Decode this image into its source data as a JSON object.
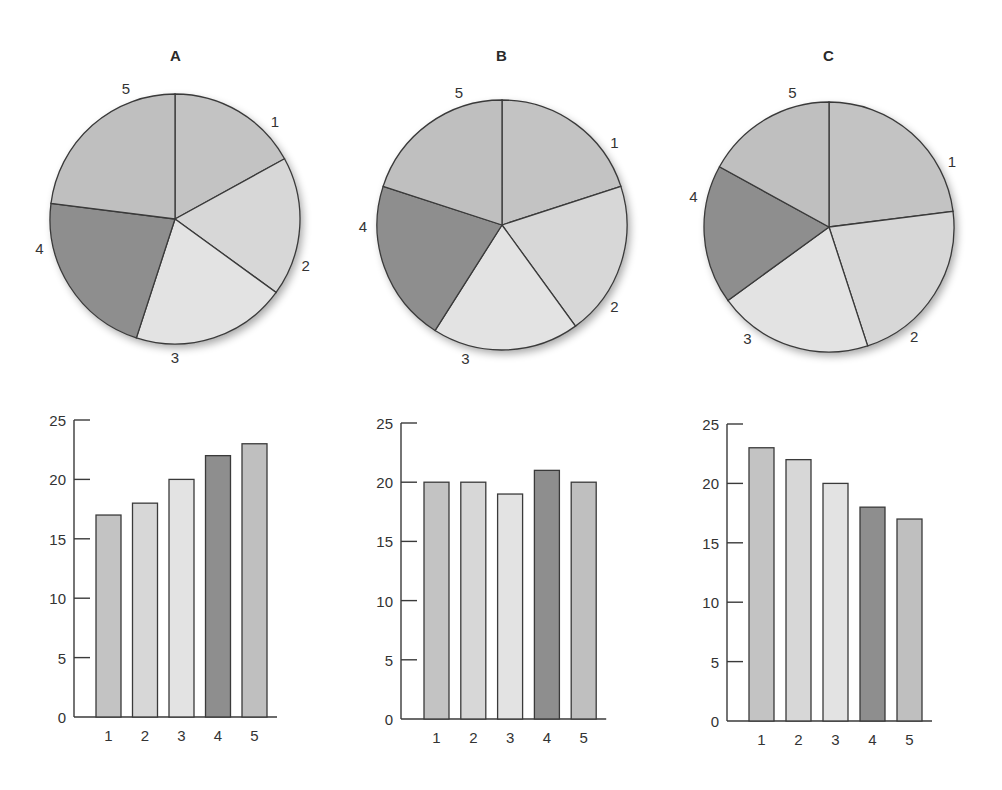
{
  "panels": [
    {
      "title": "A"
    },
    {
      "title": "B"
    },
    {
      "title": "C"
    }
  ],
  "colors": {
    "slice1": "#c3c3c3",
    "slice2": "#d7d7d7",
    "slice3": "#e3e3e3",
    "slice4": "#8e8e8e",
    "slice5": "#bfbfbf",
    "stroke": "#3a3a3a"
  },
  "chart_data": [
    {
      "type": "pie",
      "title": "A",
      "categories": [
        "1",
        "2",
        "3",
        "4",
        "5"
      ],
      "values": [
        17,
        18,
        20,
        22,
        23
      ]
    },
    {
      "type": "pie",
      "title": "B",
      "categories": [
        "1",
        "2",
        "3",
        "4",
        "5"
      ],
      "values": [
        20,
        20,
        19,
        21,
        20
      ]
    },
    {
      "type": "pie",
      "title": "C",
      "categories": [
        "1",
        "2",
        "3",
        "4",
        "5"
      ],
      "values": [
        23,
        22,
        20,
        18,
        17
      ]
    },
    {
      "type": "bar",
      "title": "",
      "categories": [
        "1",
        "2",
        "3",
        "4",
        "5"
      ],
      "values": [
        17,
        18,
        20,
        22,
        23
      ],
      "xlabel": "",
      "ylabel": "",
      "ylim": [
        0,
        25
      ],
      "yticks": [
        0,
        5,
        10,
        15,
        20,
        25
      ],
      "grid": false
    },
    {
      "type": "bar",
      "title": "",
      "categories": [
        "1",
        "2",
        "3",
        "4",
        "5"
      ],
      "values": [
        20,
        20,
        19,
        21,
        20
      ],
      "xlabel": "",
      "ylabel": "",
      "ylim": [
        0,
        25
      ],
      "yticks": [
        0,
        5,
        10,
        15,
        20,
        25
      ],
      "grid": false
    },
    {
      "type": "bar",
      "title": "",
      "categories": [
        "1",
        "2",
        "3",
        "4",
        "5"
      ],
      "values": [
        23,
        22,
        20,
        18,
        17
      ],
      "xlabel": "",
      "ylabel": "",
      "ylim": [
        0,
        25
      ],
      "yticks": [
        0,
        5,
        10,
        15,
        20,
        25
      ],
      "grid": false
    }
  ]
}
